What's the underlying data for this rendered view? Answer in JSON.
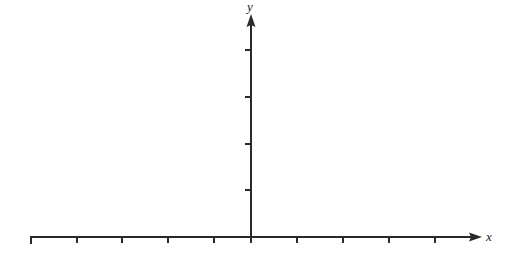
{
  "diagram": {
    "type": "coordinate-axes",
    "x_axis": {
      "label": "x",
      "origin_px": [
        251,
        237
      ],
      "left_end_px": 30,
      "arrow_tip_px": 481,
      "tick_spacing_px": 46,
      "ticks_left_of_origin": 5,
      "ticks_right_of_origin": 4,
      "tick_labels": []
    },
    "y_axis": {
      "label": "y",
      "arrow_tip_px": 14,
      "tick_spacing_px": 46.7,
      "ticks_above_origin": 4,
      "tick_labels": []
    },
    "colors": {
      "axis": "#2a2a2a",
      "background": "#ffffff"
    }
  }
}
